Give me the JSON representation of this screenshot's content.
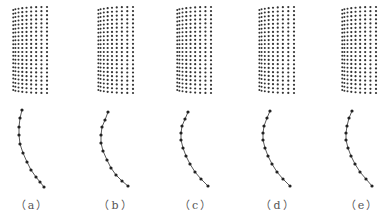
{
  "figure": {
    "background": "#ffffff",
    "dot_color": "#333333",
    "line_color": "#444444",
    "panels": [
      {
        "id": "a",
        "label": "（a）",
        "label_x": 32,
        "grid": {
          "x0": 12,
          "x1": 47,
          "y0": 7,
          "y1": 93,
          "cols": 9,
          "rows": 22,
          "curl": 10
        },
        "curve": [
          [
            22,
            110
          ],
          [
            20,
            118
          ],
          [
            19,
            127
          ],
          [
            19,
            135
          ],
          [
            20,
            144
          ],
          [
            23,
            153
          ],
          [
            27,
            162
          ],
          [
            31,
            170
          ],
          [
            36,
            177
          ],
          [
            40,
            182
          ],
          [
            44,
            187
          ]
        ]
      },
      {
        "id": "b",
        "label": "（b）",
        "label_x": 116,
        "grid": {
          "x0": 97,
          "x1": 133,
          "y0": 7,
          "y1": 93,
          "cols": 9,
          "rows": 22,
          "curl": 10
        },
        "curve": [
          [
            108,
            112
          ],
          [
            105,
            120
          ],
          [
            102,
            127
          ],
          [
            101,
            135
          ],
          [
            101,
            143
          ],
          [
            103,
            151
          ],
          [
            107,
            160
          ],
          [
            111,
            168
          ],
          [
            116,
            175
          ],
          [
            122,
            181
          ],
          [
            128,
            186
          ]
        ]
      },
      {
        "id": "c",
        "label": "（c）",
        "label_x": 196,
        "grid": {
          "x0": 176,
          "x1": 211,
          "y0": 7,
          "y1": 93,
          "cols": 9,
          "rows": 22,
          "curl": 10
        },
        "curve": [
          [
            188,
            112
          ],
          [
            185,
            119
          ],
          [
            182,
            126
          ],
          [
            181,
            133
          ],
          [
            181,
            140
          ],
          [
            183,
            148
          ],
          [
            186,
            156
          ],
          [
            190,
            164
          ],
          [
            195,
            172
          ],
          [
            201,
            179
          ],
          [
            208,
            186
          ]
        ]
      },
      {
        "id": "d",
        "label": "（d）",
        "label_x": 278,
        "grid": {
          "x0": 258,
          "x1": 294,
          "y0": 7,
          "y1": 93,
          "cols": 9,
          "rows": 22,
          "curl": 10
        },
        "curve": [
          [
            270,
            111
          ],
          [
            267,
            118
          ],
          [
            264,
            126
          ],
          [
            263,
            133
          ],
          [
            263,
            140
          ],
          [
            265,
            148
          ],
          [
            268,
            156
          ],
          [
            272,
            164
          ],
          [
            277,
            172
          ],
          [
            283,
            179
          ],
          [
            290,
            186
          ]
        ]
      },
      {
        "id": "e",
        "label": "（e）",
        "label_x": 362,
        "grid": {
          "x0": 341,
          "x1": 376,
          "y0": 7,
          "y1": 93,
          "cols": 9,
          "rows": 22,
          "curl": 10
        },
        "curve": [
          [
            352,
            111
          ],
          [
            349,
            118
          ],
          [
            347,
            126
          ],
          [
            346,
            133
          ],
          [
            346,
            140
          ],
          [
            348,
            148
          ],
          [
            351,
            156
          ],
          [
            355,
            164
          ],
          [
            360,
            172
          ],
          [
            366,
            179
          ],
          [
            372,
            186
          ]
        ]
      }
    ]
  }
}
